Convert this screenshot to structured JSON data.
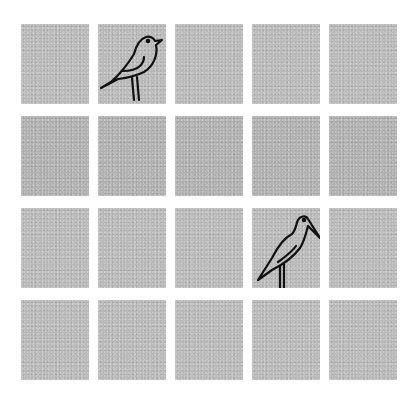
{
  "board": {
    "rows": 4,
    "cols": 5,
    "tile_color": "#b9b9b9",
    "background": "#ffffff",
    "tiles": [
      {
        "row": 0,
        "col": 0,
        "icon": null
      },
      {
        "row": 0,
        "col": 1,
        "icon": "songbird-icon"
      },
      {
        "row": 0,
        "col": 2,
        "icon": null
      },
      {
        "row": 0,
        "col": 3,
        "icon": null
      },
      {
        "row": 0,
        "col": 4,
        "icon": null
      },
      {
        "row": 1,
        "col": 0,
        "icon": null
      },
      {
        "row": 1,
        "col": 1,
        "icon": null
      },
      {
        "row": 1,
        "col": 2,
        "icon": null
      },
      {
        "row": 1,
        "col": 3,
        "icon": null
      },
      {
        "row": 1,
        "col": 4,
        "icon": null
      },
      {
        "row": 2,
        "col": 0,
        "icon": null
      },
      {
        "row": 2,
        "col": 1,
        "icon": null
      },
      {
        "row": 2,
        "col": 2,
        "icon": null
      },
      {
        "row": 2,
        "col": 3,
        "icon": "heron-icon"
      },
      {
        "row": 2,
        "col": 4,
        "icon": null
      },
      {
        "row": 3,
        "col": 0,
        "icon": null
      },
      {
        "row": 3,
        "col": 1,
        "icon": null
      },
      {
        "row": 3,
        "col": 2,
        "icon": null
      },
      {
        "row": 3,
        "col": 3,
        "icon": null
      },
      {
        "row": 3,
        "col": 4,
        "icon": null
      }
    ]
  }
}
